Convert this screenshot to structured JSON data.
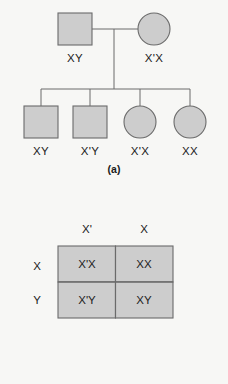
{
  "figure": {
    "background_color": "#f7f7f5",
    "shape_fill_color": "#cdcdcd",
    "stroke_color": "#6b6b6b",
    "text_color": "#222222"
  },
  "panel_a": {
    "caption": "(a)",
    "parents": [
      {
        "symbol": "square",
        "sex": "male",
        "genotype": "XY"
      },
      {
        "symbol": "circle",
        "sex": "female",
        "genotype": "X'X"
      }
    ],
    "children": [
      {
        "symbol": "square",
        "sex": "male",
        "genotype": "XY"
      },
      {
        "symbol": "square",
        "sex": "male",
        "genotype": "X'Y"
      },
      {
        "symbol": "circle",
        "sex": "female",
        "genotype": "X'X"
      },
      {
        "symbol": "circle",
        "sex": "female",
        "genotype": "XX"
      }
    ]
  },
  "panel_b": {
    "caption": "(b)",
    "column_headers": [
      "X'",
      "X"
    ],
    "row_headers": [
      "X",
      "Y"
    ],
    "cells": [
      [
        "X'X",
        "XX"
      ],
      [
        "X'Y",
        "XY"
      ]
    ]
  }
}
